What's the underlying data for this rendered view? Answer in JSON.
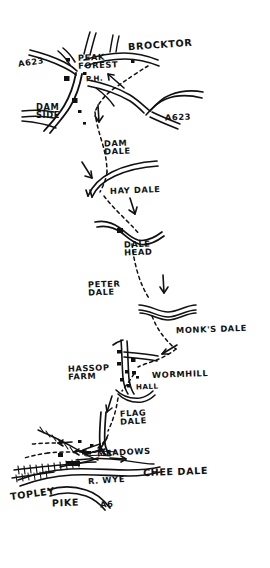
{
  "map": {
    "title": "Hand-drawn walking route map",
    "region": "Peak District — Peak Forest to Topley Pike",
    "background_color": "#ffffff",
    "ink_color": "#111111",
    "width": 270,
    "height": 568
  },
  "labels": {
    "a623_west": "A623",
    "brocktor": "BROCKTOR",
    "peak_forest": "PEAK\nFOREST",
    "public_house": "P.H.",
    "dam_side": "DAM\nSIDE",
    "a623_east": "A623",
    "dam_dale": "DAM\nDALE",
    "hay_dale": "HAY DALE",
    "dale_head": "DALE\nHEAD",
    "peter_dale": "PETER\nDALE",
    "monks_dale": "MONK'S DALE",
    "hassop_farm": "HASSOP\nFARM",
    "wormhill": "WORMHILL",
    "hall": "HALL",
    "flag_dale": "FLAG\nDALE",
    "meadows": "MEADOWS",
    "chee_dale": "CHEE DALE",
    "river_wye": "R. WYE",
    "topley": "TOPLEY",
    "pike": "PIKE",
    "a6": "A6"
  },
  "label_positions": {
    "a623_west": {
      "x": 18,
      "y": 58,
      "size": "lbl-md",
      "rotate": -8
    },
    "brocktor": {
      "x": 128,
      "y": 40,
      "size": "lbl-lg",
      "rotate": -4
    },
    "peak_forest": {
      "x": 78,
      "y": 53,
      "size": "lbl-md",
      "rotate": -2
    },
    "public_house": {
      "x": 86,
      "y": 75,
      "size": "lbl-sm",
      "rotate": -2
    },
    "dam_side": {
      "x": 36,
      "y": 103,
      "size": "lbl-md",
      "rotate": 0
    },
    "a623_east": {
      "x": 165,
      "y": 113,
      "size": "lbl-md",
      "rotate": -2
    },
    "dam_dale": {
      "x": 104,
      "y": 139,
      "size": "lbl-md",
      "rotate": -2
    },
    "hay_dale": {
      "x": 110,
      "y": 186,
      "size": "lbl-md",
      "rotate": -2
    },
    "dale_head": {
      "x": 124,
      "y": 240,
      "size": "lbl-md",
      "rotate": -2
    },
    "peter_dale": {
      "x": 88,
      "y": 280,
      "size": "lbl-md",
      "rotate": -2
    },
    "monks_dale": {
      "x": 176,
      "y": 325,
      "size": "lbl-md",
      "rotate": -2
    },
    "hassop_farm": {
      "x": 68,
      "y": 364,
      "size": "lbl-md",
      "rotate": -2
    },
    "wormhill": {
      "x": 152,
      "y": 370,
      "size": "lbl-md",
      "rotate": -2
    },
    "hall": {
      "x": 136,
      "y": 383,
      "size": "lbl-sm",
      "rotate": -2
    },
    "flag_dale": {
      "x": 120,
      "y": 409,
      "size": "lbl-md",
      "rotate": -3
    },
    "meadows": {
      "x": 97,
      "y": 448,
      "size": "lbl-md",
      "rotate": -3
    },
    "chee_dale": {
      "x": 143,
      "y": 467,
      "size": "lbl-lg",
      "rotate": -2
    },
    "river_wye": {
      "x": 88,
      "y": 476,
      "size": "lbl-md",
      "rotate": -4
    },
    "topley": {
      "x": 10,
      "y": 489,
      "size": "lbl-lg",
      "rotate": -8
    },
    "pike": {
      "x": 52,
      "y": 498,
      "size": "lbl-lg",
      "rotate": -2
    },
    "a6": {
      "x": 100,
      "y": 500,
      "size": "lbl-md",
      "rotate": -4
    }
  },
  "route": {
    "type": "dashed-footpath",
    "waypoints": [
      "Peak Forest",
      "Dam Side",
      "Dam Dale",
      "Hay Dale",
      "Dale Head",
      "Peter Dale",
      "Monk's Dale",
      "Wormhill",
      "Hassop Farm",
      "Flag Dale",
      "Meadows",
      "Chee Dale",
      "Topley Pike"
    ]
  },
  "features": {
    "roads": [
      "A623",
      "A6"
    ],
    "river": "R. WYE",
    "settlements": [
      "Peak Forest",
      "Brocktor",
      "Dam Side",
      "Wormhill",
      "Hassop Farm"
    ],
    "buildings_count": 12,
    "direction_arrows": 9
  }
}
